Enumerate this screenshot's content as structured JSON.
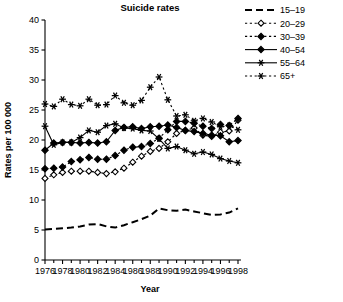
{
  "chart_data": {
    "type": "line",
    "title": "Suicide rates",
    "xlabel": "Year",
    "ylabel": "Rates per 100 000",
    "xlim": [
      1976,
      1998
    ],
    "ylim": [
      0,
      40
    ],
    "ytick_step": 5,
    "xtick_step": 1,
    "xticklabel_step": 2,
    "grid": false,
    "legend_position": "top-right",
    "x": [
      1976,
      1977,
      1978,
      1979,
      1980,
      1981,
      1982,
      1983,
      1984,
      1985,
      1986,
      1987,
      1988,
      1989,
      1990,
      1991,
      1992,
      1993,
      1994,
      1995,
      1996,
      1997,
      1998
    ],
    "xticklabels": [
      "1976",
      "1978",
      "1980",
      "1982",
      "1984",
      "1986",
      "1988",
      "1990",
      "1992",
      "1994",
      "1996",
      "1998"
    ],
    "yticklabels": [
      "0",
      "5",
      "10",
      "15",
      "20",
      "25",
      "30",
      "35",
      "40"
    ],
    "series": [
      {
        "name": "15–19",
        "marker": "none",
        "linestyle": "dashed",
        "values": [
          5.1,
          5.2,
          5.3,
          5.4,
          5.6,
          5.9,
          6.0,
          5.6,
          5.4,
          5.8,
          6.3,
          6.8,
          7.4,
          8.6,
          8.3,
          8.2,
          8.4,
          8.1,
          7.8,
          7.5,
          7.6,
          7.9,
          8.6
        ]
      },
      {
        "name": "20–29",
        "marker": "open-diamond",
        "linestyle": "dotted",
        "values": [
          13.6,
          14.2,
          14.6,
          14.8,
          14.8,
          14.8,
          14.6,
          14.4,
          14.7,
          15.3,
          16.3,
          17.3,
          18.1,
          18.6,
          19.7,
          21.1,
          21.6,
          22.0,
          20.8,
          20.6,
          21.3,
          21.5,
          23.3
        ]
      },
      {
        "name": "30–39",
        "marker": "filled-diamond",
        "linestyle": "dotted",
        "values": [
          15.2,
          15.3,
          15.5,
          16.4,
          16.7,
          17.1,
          16.8,
          16.8,
          17.4,
          18.3,
          18.8,
          18.9,
          19.4,
          20.3,
          21.7,
          23.1,
          23.1,
          22.8,
          22.3,
          21.9,
          22.6,
          22.4,
          23.6
        ]
      },
      {
        "name": "40–54",
        "marker": "filled-diamond",
        "linestyle": "solid",
        "values": [
          18.3,
          19.5,
          19.6,
          19.6,
          19.5,
          19.6,
          19.5,
          19.7,
          21.6,
          22.1,
          22.2,
          21.9,
          22.2,
          22.3,
          22.5,
          22.1,
          21.6,
          21.4,
          21.1,
          20.8,
          20.7,
          19.7,
          19.9
        ]
      },
      {
        "name": "55–64",
        "marker": "asterisk",
        "linestyle": "solid",
        "values": [
          22.3,
          19.2,
          19.6,
          19.6,
          20.4,
          21.6,
          21.3,
          22.4,
          22.7,
          22.0,
          21.9,
          21.6,
          21.5,
          20.2,
          18.6,
          18.9,
          18.3,
          17.7,
          18.0,
          17.6,
          16.9,
          16.5,
          16.2
        ]
      },
      {
        "name": "65+",
        "marker": "asterisk",
        "linestyle": "dotted",
        "values": [
          26.0,
          25.6,
          26.8,
          25.9,
          25.7,
          26.8,
          25.8,
          25.9,
          27.4,
          26.2,
          25.8,
          26.6,
          28.8,
          30.5,
          26.7,
          24.0,
          24.2,
          23.2,
          23.6,
          23.0,
          22.2,
          22.4,
          21.7
        ]
      }
    ]
  },
  "legend": {
    "items": [
      {
        "label": "15–19"
      },
      {
        "label": "20–29"
      },
      {
        "label": "30–39"
      },
      {
        "label": "40–54"
      },
      {
        "label": "55–64"
      },
      {
        "label": "65+"
      }
    ]
  },
  "colors": {
    "ink": "#000000",
    "background": "#ffffff"
  }
}
